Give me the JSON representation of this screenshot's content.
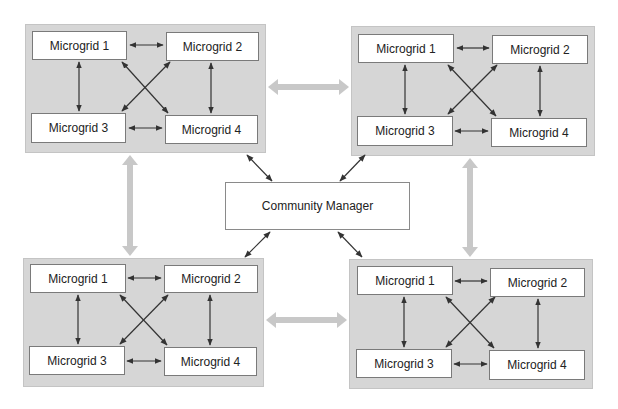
{
  "diagram": {
    "center": {
      "label": "Community Manager"
    },
    "clusters": [
      {
        "id": "top-left",
        "nodes": [
          "Microgrid 1",
          "Microgrid 2",
          "Microgrid 3",
          "Microgrid 4"
        ]
      },
      {
        "id": "top-right",
        "nodes": [
          "Microgrid 1",
          "Microgrid 2",
          "Microgrid 3",
          "Microgrid 4"
        ]
      },
      {
        "id": "bottom-left",
        "nodes": [
          "Microgrid 1",
          "Microgrid 2",
          "Microgrid 3",
          "Microgrid 4"
        ]
      },
      {
        "id": "bottom-right",
        "nodes": [
          "Microgrid 1",
          "Microgrid 2",
          "Microgrid 3",
          "Microgrid 4"
        ]
      }
    ],
    "intra_cluster_links": "each microgrid bidirectionally linked to the other three",
    "inter_cluster_links": [
      "top-left <-> top-right",
      "top-left <-> bottom-left",
      "top-right <-> bottom-right",
      "bottom-left <-> bottom-right"
    ],
    "manager_links": [
      "top-left",
      "top-right",
      "bottom-left",
      "bottom-right"
    ],
    "colors": {
      "cluster_bg": "#d6d6d6",
      "wide_arrow": "#c8c8c8",
      "line": "#333333",
      "node_bg": "#ffffff"
    }
  }
}
